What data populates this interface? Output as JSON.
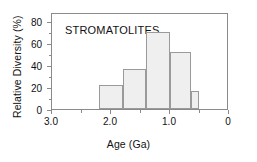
{
  "chart_data": {
    "type": "bar",
    "title": "STROMATOLITES",
    "xlabel": "Age  (Ga)",
    "ylabel": "Relative Diversity (%)",
    "xlim": [
      3.0,
      0
    ],
    "ylim": [
      0,
      88
    ],
    "x_reversed": true,
    "grid": false,
    "legend": null,
    "bar_color": "#efefef",
    "bar_edge_color": "#9a9a9a",
    "axis_color": "#8a8a8a",
    "text_color": "#111111",
    "xticks": [
      3.0,
      2.0,
      1.0,
      0
    ],
    "xtick_labels": [
      "3.0",
      "2.0",
      "1.0",
      "0"
    ],
    "xminor_ticks": [
      2.5,
      1.5,
      0.5
    ],
    "yticks": [
      0,
      20,
      40,
      60,
      80
    ],
    "ytick_labels": [
      "0",
      "20",
      "40",
      "60",
      "80"
    ],
    "yminor_ticks": [
      10,
      30,
      50,
      70
    ],
    "bins": [
      {
        "x_start": 2.2,
        "x_end": 1.8,
        "value": 22
      },
      {
        "x_start": 1.8,
        "x_end": 1.4,
        "value": 36
      },
      {
        "x_start": 1.4,
        "x_end": 1.0,
        "value": 70
      },
      {
        "x_start": 1.0,
        "x_end": 0.65,
        "value": 52
      },
      {
        "x_start": 0.65,
        "x_end": 0.5,
        "value": 16
      }
    ],
    "categories": [
      "2.2-1.8",
      "1.8-1.4",
      "1.4-1.0",
      "1.0-0.65",
      "0.65-0.5"
    ],
    "values": [
      22,
      36,
      70,
      52,
      16
    ]
  }
}
